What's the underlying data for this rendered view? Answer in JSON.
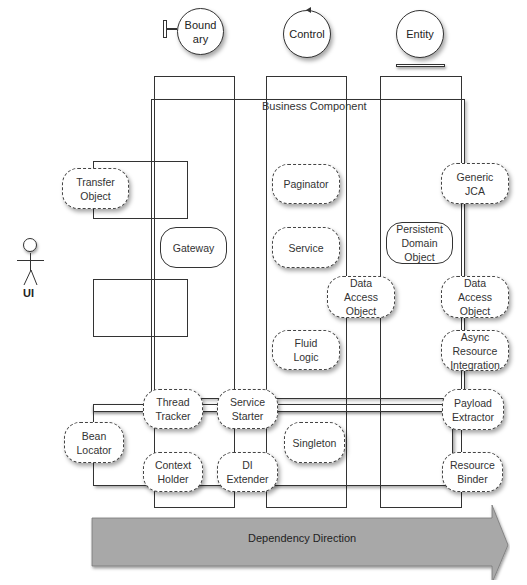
{
  "stereotypes": [
    {
      "id": "boundary",
      "label": "Bound\nary"
    },
    {
      "id": "control",
      "label": "Control"
    },
    {
      "id": "entity",
      "label": "Entity"
    }
  ],
  "business_component": {
    "label": "Business Component"
  },
  "actor": {
    "label": "UI"
  },
  "patterns": {
    "transfer_object": "Transfer\nObject",
    "gateway": "Gateway",
    "paginator": "Paginator",
    "service": "Service",
    "dao_control": "Data\nAccess\nObject",
    "fluid_logic": "Fluid\nLogic",
    "persistent_domain_object": "Persistent\nDomain\nObject",
    "generic_jca": "Generic\nJCA",
    "dao_entity": "Data\nAccess\nObject",
    "async_resource_integration": "Async\nResource\nIntegration",
    "thread_tracker": "Thread\nTracker",
    "service_starter": "Service\nStarter",
    "bean_locator": "Bean\nLocator",
    "context_holder": "Context\nHolder",
    "di_extender": "DI\nExtender",
    "singleton": "Singleton",
    "payload_extractor": "Payload\nExtractor",
    "resource_binder": "Resource\nBinder"
  },
  "arrow": {
    "label": "Dependency Direction",
    "fill": "#a8a8a8"
  }
}
